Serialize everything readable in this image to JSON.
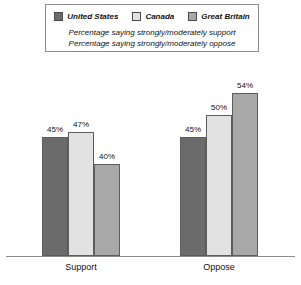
{
  "legend": {
    "entries": [
      {
        "label": "United States",
        "color": "#6b6b6b",
        "swatch_name": "legend-swatch-united-states"
      },
      {
        "label": "Canada",
        "color": "#e2e2e2",
        "swatch_name": "legend-swatch-canada"
      },
      {
        "label": "Great Britain",
        "color": "#a8a8a8",
        "swatch_name": "legend-swatch-great-britain"
      }
    ],
    "subtitles": [
      "Percentage saying strongly/moderately support",
      "Percentage saying strongly/moderately oppose"
    ]
  },
  "chart_data": {
    "type": "bar",
    "title": "",
    "xlabel": "",
    "ylabel": "",
    "ylim": [
      0,
      60
    ],
    "grid": false,
    "legend_position": "top",
    "categories": [
      "Support",
      "Oppose"
    ],
    "series": [
      {
        "name": "United States",
        "color": "#6b6b6b",
        "values": [
          45,
          45
        ],
        "labels": [
          "45%",
          "45%"
        ]
      },
      {
        "name": "Canada",
        "color": "#e2e2e2",
        "values": [
          47,
          50
        ],
        "labels": [
          "47%",
          "50%"
        ]
      },
      {
        "name": "Great Britain",
        "color": "#a8a8a8",
        "values": [
          40,
          54
        ],
        "labels": [
          "40%",
          "54%"
        ]
      }
    ]
  },
  "bars": [
    {
      "name": "bar-support-united-states",
      "group": "Support",
      "series": "United States",
      "value": 45,
      "label": "45%",
      "color": "#6b6b6b",
      "left": 42,
      "width": 26,
      "height": 119,
      "label_left": 39,
      "label_top": 125
    },
    {
      "name": "bar-support-canada",
      "group": "Support",
      "series": "Canada",
      "value": 47,
      "label": "47%",
      "color": "#e2e2e2",
      "left": 68,
      "width": 26,
      "height": 124,
      "label_left": 65,
      "label_top": 120
    },
    {
      "name": "bar-support-great-britain",
      "group": "Support",
      "series": "Great Britain",
      "value": 40,
      "label": "40%",
      "color": "#a8a8a8",
      "left": 94,
      "width": 26,
      "height": 92,
      "label_left": 91,
      "label_top": 152
    },
    {
      "name": "bar-oppose-united-states",
      "group": "Oppose",
      "series": "United States",
      "value": 45,
      "label": "45%",
      "color": "#6b6b6b",
      "left": 180,
      "width": 26,
      "height": 119,
      "label_left": 177,
      "label_top": 125
    },
    {
      "name": "bar-oppose-canada",
      "group": "Oppose",
      "series": "Canada",
      "value": 50,
      "label": "50%",
      "color": "#e2e2e2",
      "left": 206,
      "width": 26,
      "height": 141,
      "label_left": 203,
      "label_top": 103
    },
    {
      "name": "bar-oppose-great-britain",
      "group": "Oppose",
      "series": "Great Britain",
      "value": 54,
      "label": "54%",
      "color": "#a8a8a8",
      "left": 232,
      "width": 26,
      "height": 163,
      "label_left": 229,
      "label_top": 81
    }
  ],
  "category_labels": [
    {
      "name": "category-label-support",
      "text": "Support",
      "left": 41,
      "width": 80
    },
    {
      "name": "category-label-oppose",
      "text": "Oppose",
      "left": 179,
      "width": 80
    }
  ]
}
